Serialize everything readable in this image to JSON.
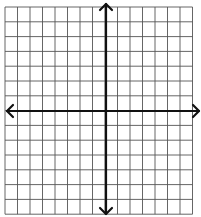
{
  "diagram": {
    "type": "coordinate-plane",
    "title": "",
    "grid": {
      "left": 5,
      "top": 7,
      "columns": 15,
      "rows": 14,
      "cell_width": 12.5,
      "cell_height": 14.8,
      "line_color": "#555555",
      "line_width": 0.9
    },
    "axes": {
      "color": "#111111",
      "width": 2.2,
      "y_axis_x": 106,
      "x_axis_y": 111,
      "x_axis_from": 7,
      "x_axis_to": 199,
      "y_axis_from": 4,
      "y_axis_to": 214,
      "arrows": [
        "left",
        "right",
        "up",
        "down"
      ]
    },
    "labels": []
  }
}
